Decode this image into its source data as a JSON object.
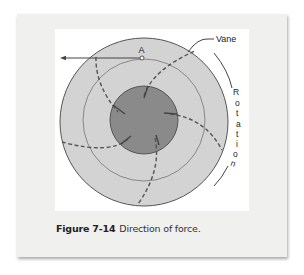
{
  "figure": {
    "label": "Figure 7-14",
    "title": "Direction of force."
  },
  "diagram": {
    "point_label": "A",
    "vane_label": "Vane",
    "rotation_letters": [
      "R",
      "o",
      "t",
      "a",
      "t",
      "i",
      "o",
      "n"
    ],
    "colors": {
      "outer_disc": "#d3d3d3",
      "inner_hub": "#8a8a8a",
      "stroke": "#555555",
      "card_bg": "#f0f0ee"
    }
  }
}
